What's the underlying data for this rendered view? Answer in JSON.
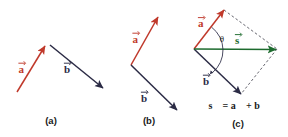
{
  "figure": {
    "background_color": "#ffffff",
    "width": 288,
    "height": 137
  },
  "colors": {
    "vector_a": "#c0392b",
    "vector_b": "#2b2b45",
    "vector_s": "#1d6b2e",
    "dashed_guide": "#55555f",
    "text": "#1a1a1a"
  },
  "panels": [
    {
      "id": "a",
      "caption": "(a)",
      "description": "Two separate vectors drawn apart",
      "labels": [
        {
          "name": "vector-a-label",
          "text": "a⃗",
          "glyph": "a",
          "color": "#c0392b"
        },
        {
          "name": "vector-b-label",
          "text": "b⃗",
          "glyph": "b",
          "color": "#2b2b45"
        }
      ]
    },
    {
      "id": "b",
      "caption": "(b)",
      "description": "Vectors joined tail to tail at a common origin",
      "labels": [
        {
          "name": "vector-a-label",
          "text": "a⃗",
          "glyph": "a",
          "color": "#c0392b"
        },
        {
          "name": "vector-b-label",
          "text": "b⃗",
          "glyph": "b",
          "color": "#2b2b45"
        }
      ]
    },
    {
      "id": "c",
      "caption": "(c)",
      "description": "Parallelogram completed, resultant drawn as diagonal",
      "angle_symbol": "θ",
      "equation": "s⃗ = a⃗ + b⃗",
      "equation_parts": {
        "result": "s",
        "equals": "=",
        "first": "a",
        "plus": "+",
        "second": "b"
      },
      "labels": [
        {
          "name": "vector-a-label",
          "text": "a⃗",
          "glyph": "a",
          "color": "#c0392b"
        },
        {
          "name": "vector-b-label",
          "text": "b⃗",
          "glyph": "b",
          "color": "#2b2b45"
        },
        {
          "name": "vector-s-label",
          "text": "s⃗",
          "glyph": "s",
          "color": "#1d6b2e"
        }
      ]
    }
  ],
  "captions": {
    "panel_a": "(a)",
    "panel_b": "(b)",
    "panel_c": "(c)"
  },
  "vector_glyphs": {
    "a": "a",
    "b": "b",
    "s": "s",
    "theta": "θ",
    "equals": "=",
    "plus": "+"
  }
}
